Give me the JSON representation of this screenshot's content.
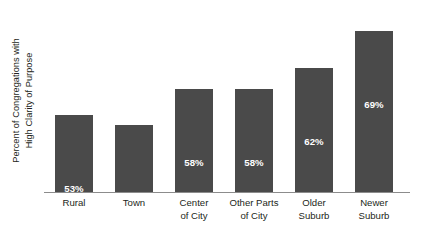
{
  "chart_data": {
    "type": "bar",
    "title": "",
    "xlabel": "",
    "ylabel": "Percent of Congregations with High Clarity of Purpose",
    "ylabel_lines": [
      "Percent of Congregations with",
      "High Clarity of Purpose"
    ],
    "categories": [
      "Rural",
      "Town",
      "Center of City",
      "Other Parts of City",
      "Older Suburb",
      "Newer Suburb"
    ],
    "category_lines": [
      [
        "Rural"
      ],
      [
        "Town"
      ],
      [
        "Center",
        "of City"
      ],
      [
        "Other Parts",
        "of City"
      ],
      [
        "Older",
        "Suburb"
      ],
      [
        "Newer",
        "Suburb"
      ]
    ],
    "values": [
      53,
      51,
      58,
      58,
      62,
      69
    ],
    "value_labels": [
      "53%",
      "51%",
      "58%",
      "58%",
      "62%",
      "69%"
    ],
    "ylim": [
      38,
      75
    ],
    "grid": false,
    "legend": false,
    "bar_color": "#4a4a4a",
    "value_label_color": "#ffffff",
    "axis_line_color": "#8c8c8c",
    "background_color": "#ffffff",
    "text_color": "#231f20"
  }
}
